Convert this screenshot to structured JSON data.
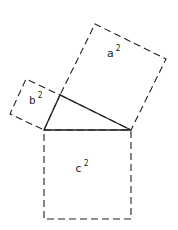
{
  "diagram": {
    "colors": {
      "stroke": "#222222",
      "background": "#ffffff"
    },
    "triangle": {
      "points": [
        [
          44,
          130
        ],
        [
          60,
          95
        ],
        [
          131,
          130
        ]
      ]
    },
    "squares": [
      {
        "id": "a",
        "label": "a",
        "exponent": "2",
        "points": [
          [
            60,
            95
          ],
          [
            131,
            130
          ],
          [
            166,
            59
          ],
          [
            95,
            24
          ]
        ],
        "label_pos": [
          107,
          57
        ]
      },
      {
        "id": "b",
        "label": "b",
        "exponent": "2",
        "points": [
          [
            44,
            130
          ],
          [
            60,
            95
          ],
          [
            26,
            79
          ],
          [
            10,
            114
          ]
        ],
        "label_pos": [
          29,
          104
        ]
      },
      {
        "id": "c",
        "label": "c",
        "exponent": "2",
        "points": [
          [
            44,
            130
          ],
          [
            131,
            130
          ],
          [
            131,
            219
          ],
          [
            44,
            219
          ]
        ],
        "label_pos": [
          75,
          172
        ]
      }
    ]
  }
}
